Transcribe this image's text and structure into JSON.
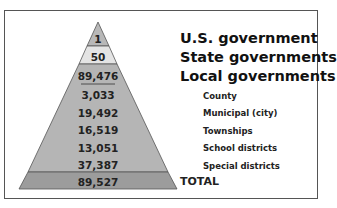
{
  "levels": [
    {
      "label": "U.S. government",
      "value": "1"
    },
    {
      "label": "State governments",
      "value": "50"
    },
    {
      "label": "Local governments",
      "value": "89,476"
    }
  ],
  "local_breakdown": [
    {
      "label": "County",
      "value": "3,033"
    },
    {
      "label": "Municipal (city)",
      "value": "19,492"
    },
    {
      "label": "Townships",
      "value": "16,519"
    },
    {
      "label": "School districts",
      "value": "13,051"
    },
    {
      "label": "Special districts",
      "value": "37,387"
    }
  ],
  "total": {
    "label": "TOTAL",
    "value": "89,527"
  },
  "colors": {
    "tier1": "#b8b8b8",
    "tier2": "#e4e4e4",
    "tier3": "#b5b5b5",
    "total": "#9c9c9c",
    "line": "#555555"
  }
}
